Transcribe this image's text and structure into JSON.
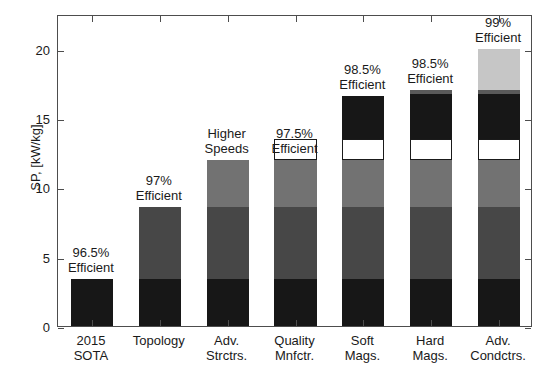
{
  "chart_data": {
    "type": "bar",
    "subtype": "stacked-bar",
    "title": "",
    "xlabel": "",
    "ylabel": "SP, [kW/kg]",
    "ylim": [
      0,
      22.5
    ],
    "yticks": [
      0,
      5,
      10,
      15,
      20
    ],
    "ytick_labels": [
      "0",
      "5",
      "10",
      "15",
      "20"
    ],
    "grid": false,
    "legend": "none",
    "categories": [
      "2015\nSOTA",
      "Topology",
      "Adv.\nStrctrs.",
      "Quality\nMnfctr.",
      "Soft\nMags.",
      "Hard\nMags.",
      "Adv.\nCondctrs."
    ],
    "category_lines": [
      [
        "2015",
        "SOTA"
      ],
      [
        "Topology",
        ""
      ],
      [
        "Adv.",
        "Strctrs."
      ],
      [
        "Quality",
        "Mnfctr."
      ],
      [
        "Soft",
        "Mags."
      ],
      [
        "Hard",
        "Mags."
      ],
      [
        "Adv.",
        "Condctrs."
      ]
    ],
    "annotations": [
      [
        "96.5%",
        "Efficient"
      ],
      [
        "97%",
        "Efficient"
      ],
      [
        "Higher",
        "Speeds"
      ],
      [
        "97.5%",
        "Efficient"
      ],
      [
        "98.5%",
        "Efficient"
      ],
      [
        "98.5%",
        "Efficient"
      ],
      [
        "99%",
        "Efficient"
      ]
    ],
    "totals": [
      3.4,
      8.6,
      12.0,
      12.0,
      16.6,
      17.0,
      20.0
    ],
    "series": [
      {
        "name": "base-2015-sota",
        "color": "#171717",
        "values": [
          3.4,
          3.4,
          3.4,
          3.4,
          3.4,
          3.4,
          3.4
        ]
      },
      {
        "name": "topology",
        "color": "#474747",
        "values": [
          0,
          5.2,
          5.2,
          5.2,
          5.2,
          5.2,
          5.2
        ]
      },
      {
        "name": "adv-structures",
        "color": "#727272",
        "values": [
          0,
          0,
          3.4,
          3.4,
          3.4,
          3.4,
          3.4
        ]
      },
      {
        "name": "quality-mnfctr",
        "color": "#ffffff",
        "values": [
          0,
          0,
          0,
          1.5,
          1.5,
          1.5,
          1.5
        ]
      },
      {
        "name": "soft-magnets",
        "color": "#171717",
        "values": [
          0,
          0,
          0,
          0,
          3.1,
          3.5,
          3.5
        ]
      },
      {
        "name": "hard-magnets",
        "color": "#5a5a5a",
        "values": [
          0,
          0,
          0,
          0,
          0,
          0.0,
          0.0
        ]
      },
      {
        "name": "adv-conductors",
        "color": "#c6c6c6",
        "values": [
          0,
          0,
          0,
          0,
          0,
          0,
          3.0
        ]
      }
    ],
    "stacks": [
      {
        "category": "2015 SOTA",
        "segments": [
          {
            "from": 0,
            "to": 3.4,
            "color": "#171717",
            "outlined": false
          }
        ]
      },
      {
        "category": "Topology",
        "segments": [
          {
            "from": 0,
            "to": 3.4,
            "color": "#171717",
            "outlined": false
          },
          {
            "from": 3.4,
            "to": 8.6,
            "color": "#474747",
            "outlined": false
          }
        ]
      },
      {
        "category": "Adv. Strctrs.",
        "segments": [
          {
            "from": 0,
            "to": 3.4,
            "color": "#171717",
            "outlined": false
          },
          {
            "from": 3.4,
            "to": 8.6,
            "color": "#474747",
            "outlined": false
          },
          {
            "from": 8.6,
            "to": 12.0,
            "color": "#727272",
            "outlined": false
          }
        ]
      },
      {
        "category": "Quality Mnfctr.",
        "segments": [
          {
            "from": 0,
            "to": 3.4,
            "color": "#171717",
            "outlined": false
          },
          {
            "from": 3.4,
            "to": 8.6,
            "color": "#474747",
            "outlined": false
          },
          {
            "from": 8.6,
            "to": 12.0,
            "color": "#727272",
            "outlined": false
          },
          {
            "from": 12.0,
            "to": 13.5,
            "color": "#ffffff",
            "outlined": true
          }
        ]
      },
      {
        "category": "Soft Mags.",
        "segments": [
          {
            "from": 0,
            "to": 3.4,
            "color": "#171717",
            "outlined": false
          },
          {
            "from": 3.4,
            "to": 8.6,
            "color": "#474747",
            "outlined": false
          },
          {
            "from": 8.6,
            "to": 12.0,
            "color": "#727272",
            "outlined": false
          },
          {
            "from": 12.0,
            "to": 13.5,
            "color": "#ffffff",
            "outlined": true
          },
          {
            "from": 13.5,
            "to": 16.6,
            "color": "#171717",
            "outlined": false
          }
        ]
      },
      {
        "category": "Hard Mags.",
        "segments": [
          {
            "from": 0,
            "to": 3.4,
            "color": "#171717",
            "outlined": false
          },
          {
            "from": 3.4,
            "to": 8.6,
            "color": "#474747",
            "outlined": false
          },
          {
            "from": 8.6,
            "to": 12.0,
            "color": "#727272",
            "outlined": false
          },
          {
            "from": 12.0,
            "to": 13.5,
            "color": "#ffffff",
            "outlined": true
          },
          {
            "from": 13.5,
            "to": 16.7,
            "color": "#171717",
            "outlined": false
          },
          {
            "from": 16.7,
            "to": 17.0,
            "color": "#5a5a5a",
            "outlined": false
          }
        ]
      },
      {
        "category": "Adv. Condctrs.",
        "segments": [
          {
            "from": 0,
            "to": 3.4,
            "color": "#171717",
            "outlined": false
          },
          {
            "from": 3.4,
            "to": 8.6,
            "color": "#474747",
            "outlined": false
          },
          {
            "from": 8.6,
            "to": 12.0,
            "color": "#727272",
            "outlined": false
          },
          {
            "from": 12.0,
            "to": 13.5,
            "color": "#ffffff",
            "outlined": true
          },
          {
            "from": 13.5,
            "to": 16.7,
            "color": "#171717",
            "outlined": false
          },
          {
            "from": 16.7,
            "to": 17.0,
            "color": "#5a5a5a",
            "outlined": false
          },
          {
            "from": 17.0,
            "to": 20.0,
            "color": "#c6c6c6",
            "outlined": false
          }
        ]
      }
    ]
  }
}
